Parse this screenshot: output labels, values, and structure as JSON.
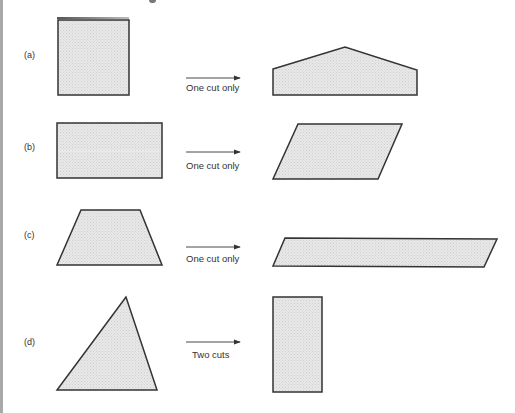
{
  "colors": {
    "fill": "#e4e4e4",
    "stroke": "#333333",
    "text": "#333333",
    "left_bar": "#a9a9a9"
  },
  "rows": [
    {
      "label": "(a)",
      "source_shape": "square",
      "operation": "One cut only",
      "target_shape": "pentagon"
    },
    {
      "label": "(b)",
      "source_shape": "rectangle",
      "operation": "One cut only",
      "target_shape": "parallelogram"
    },
    {
      "label": "(c)",
      "source_shape": "trapezoid",
      "operation": "One cut only",
      "target_shape": "long-parallelogram"
    },
    {
      "label": "(d)",
      "source_shape": "triangle",
      "operation": "Two cuts",
      "target_shape": "tall-rectangle"
    }
  ]
}
